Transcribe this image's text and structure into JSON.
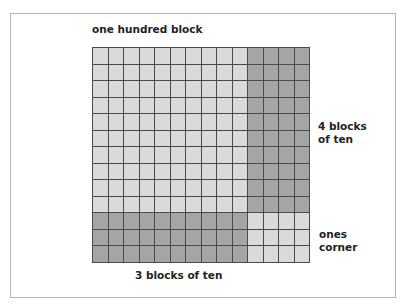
{
  "diagram": {
    "title": "one hundred block",
    "labels": {
      "right_top_line1": "4 blocks",
      "right_top_line2": "of ten",
      "right_bottom_line1": "ones",
      "right_bottom_line2": "corner",
      "bottom": "3 blocks of ten"
    },
    "grid": {
      "columns": 14,
      "rows": 13,
      "hundred_block": {
        "columns": 10,
        "rows": 10,
        "shade": "light"
      },
      "right_tens": {
        "columns": 4,
        "rows": 10,
        "shade": "dark"
      },
      "bottom_tens": {
        "columns": 10,
        "rows": 3,
        "shade": "dark"
      },
      "ones_corner": {
        "columns": 4,
        "rows": 3,
        "shade": "light"
      }
    },
    "colors": {
      "light": "#dadada",
      "dark": "#a5a5a5",
      "gridline": "#4a4a4a",
      "frame": "#b4b4b4"
    }
  }
}
